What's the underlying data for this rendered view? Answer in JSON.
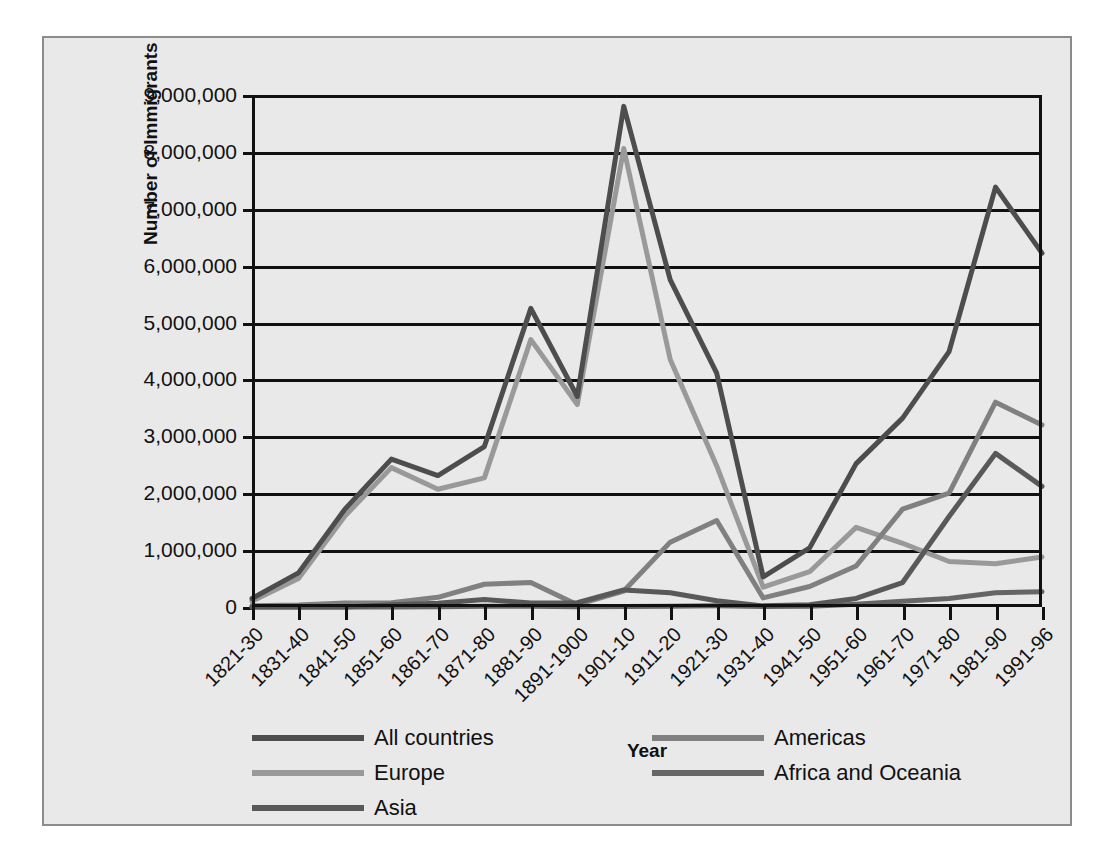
{
  "chart_data": {
    "type": "line",
    "title": "",
    "xlabel": "Year",
    "ylabel": "Number of Immigrants",
    "categories": [
      "1821-30",
      "1831-40",
      "1841-50",
      "1851-60",
      "1861-70",
      "1871-80",
      "1881-90",
      "1891-1900",
      "1901-10",
      "1911-20",
      "1921-30",
      "1931-40",
      "1941-50",
      "1951-60",
      "1961-70",
      "1971-80",
      "1981-90",
      "1991-96"
    ],
    "ylim": [
      0,
      9000000
    ],
    "ytick_labels": [
      "9,000,000",
      "8,000,000",
      "7,000,000",
      "6,000,000",
      "5,000,000",
      "4,000,000",
      "3,000,000",
      "2,000,000",
      "1,000,000",
      "0"
    ],
    "ytick_values": [
      9000000,
      8000000,
      7000000,
      6000000,
      5000000,
      4000000,
      3000000,
      2000000,
      1000000,
      0
    ],
    "grid": true,
    "legend_position": "bottom",
    "series": [
      {
        "name": "All countries",
        "color": "#4d4d4d",
        "values": [
          150000,
          600000,
          1720000,
          2600000,
          2310000,
          2820000,
          5250000,
          3700000,
          8800000,
          5750000,
          4110000,
          530000,
          1040000,
          2520000,
          3320000,
          4490000,
          7380000,
          6220000
        ]
      },
      {
        "name": "Europe",
        "color": "#999999",
        "values": [
          100000,
          500000,
          1600000,
          2450000,
          2070000,
          2270000,
          4700000,
          3560000,
          8060000,
          4350000,
          2480000,
          350000,
          620000,
          1400000,
          1120000,
          800000,
          760000,
          880000
        ]
      },
      {
        "name": "Asia",
        "color": "#595959",
        "values": [
          0,
          0,
          0,
          40000,
          65000,
          130000,
          70000,
          75000,
          300000,
          250000,
          110000,
          20000,
          40000,
          150000,
          430000,
          1590000,
          2700000,
          2120000
        ]
      },
      {
        "name": "Americas",
        "color": "#808080",
        "values": [
          20000,
          35000,
          70000,
          75000,
          170000,
          400000,
          430000,
          40000,
          280000,
          1140000,
          1520000,
          160000,
          360000,
          720000,
          1720000,
          2000000,
          3600000,
          3200000
        ]
      },
      {
        "name": "Africa and Oceania",
        "color": "#666666",
        "values": [
          0,
          0,
          0,
          0,
          5000,
          15000,
          15000,
          5000,
          10000,
          15000,
          20000,
          10000,
          15000,
          50000,
          100000,
          150000,
          250000,
          270000
        ]
      }
    ]
  },
  "legend": {
    "left_column": [
      {
        "label": "All countries",
        "color": "#4d4d4d"
      },
      {
        "label": "Europe",
        "color": "#999999"
      },
      {
        "label": "Asia",
        "color": "#595959"
      }
    ],
    "right_column": [
      {
        "label": "Americas",
        "color": "#808080"
      },
      {
        "label": "Africa and Oceania",
        "color": "#666666"
      }
    ]
  },
  "colors": {
    "panel_background": "#e9e9e9",
    "panel_border": "#8c8c8c",
    "axis": "#111111",
    "page_background": "#ffffff"
  }
}
